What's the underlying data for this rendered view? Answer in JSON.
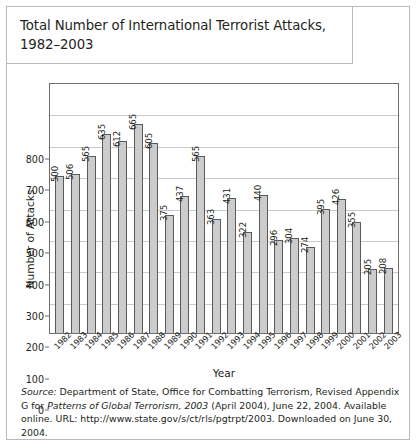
{
  "title": "Total Number of International Terrorist Attacks, 1982–2003",
  "source_note": {
    "label": "Source:",
    "line1_rest": " Department of State, Office for Combatting Terrorism, Revised Appendix G",
    "line2_prefix": "for ",
    "line2_italic": "Patterns of Global Terrorism, 2003",
    "line2_rest": " (April 2004), June 22, 2004. Available online.",
    "line3": "URL: http://www.state.gov/s/ct/rls/pgtrpt/2003. Downloaded on June 30, 2004."
  },
  "colors": {
    "bar_fill": "#cccccc",
    "bar_border": "#5a5a5a",
    "axis": "#6e6e6e",
    "grid": "#c9c9c9",
    "frame": "#b9b9b9",
    "text": "#231f20"
  },
  "chart_data": {
    "type": "bar",
    "title": "Total Number of International Terrorist Attacks, 1982–2003",
    "xlabel": "Year",
    "ylabel": "Number of Attacks",
    "ylim": [
      0,
      800
    ],
    "ytick_step": 100,
    "yticks": [
      0,
      100,
      200,
      300,
      400,
      500,
      600,
      700,
      800
    ],
    "grid": true,
    "grid_axis": "y",
    "legend": null,
    "data_labels": true,
    "data_label_rotation": -90,
    "xtick_rotation": -45,
    "categories": [
      "1982",
      "1983",
      "1984",
      "1985",
      "1986",
      "1987",
      "1988",
      "1989",
      "1990",
      "1991",
      "1992",
      "1993",
      "1994",
      "1995",
      "1996",
      "1997",
      "1998",
      "1999",
      "2000",
      "2001",
      "2002",
      "2003"
    ],
    "values": [
      500,
      506,
      565,
      635,
      612,
      665,
      605,
      375,
      437,
      565,
      363,
      431,
      322,
      440,
      296,
      304,
      274,
      395,
      426,
      355,
      205,
      208
    ]
  }
}
